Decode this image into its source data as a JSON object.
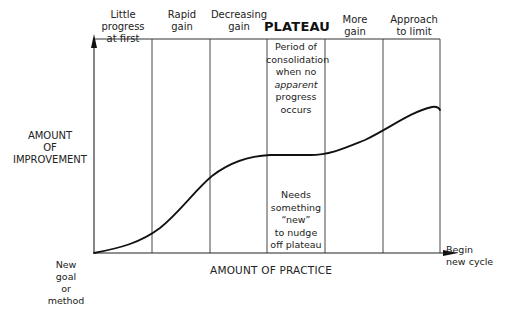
{
  "diagram": {
    "type": "learning-curve",
    "y_axis_label": [
      "AMOUNT",
      "OF",
      "IMPROVEMENT"
    ],
    "x_axis_label": "AMOUNT OF PRACTICE",
    "start_label": [
      "New",
      "goal",
      "or",
      "method"
    ],
    "end_label": [
      "Begin",
      "new cycle"
    ],
    "phases": [
      {
        "label": [
          "Little progress",
          "at first"
        ]
      },
      {
        "label": [
          "Rapid",
          "gain"
        ]
      },
      {
        "label": [
          "Decreasing",
          "gain"
        ]
      },
      {
        "label": [
          "PLATEAU"
        ],
        "emphasis": true
      },
      {
        "label": [
          "More",
          "gain"
        ]
      },
      {
        "label": [
          "Approach",
          "to limit"
        ]
      }
    ],
    "plateau_notes": {
      "top": [
        "Period of",
        "consolidation",
        "when no",
        "apparent",
        "progress",
        "occurs"
      ],
      "bottom": [
        "Needs",
        "something",
        "“new”",
        "to nudge",
        "off plateau"
      ]
    },
    "curve_shape": "S-curve rising, flattening at plateau, rising again, levelling toward limit",
    "colors": {
      "line": "#1a1a1a",
      "grid": "#333333",
      "background": "#ffffff"
    }
  }
}
